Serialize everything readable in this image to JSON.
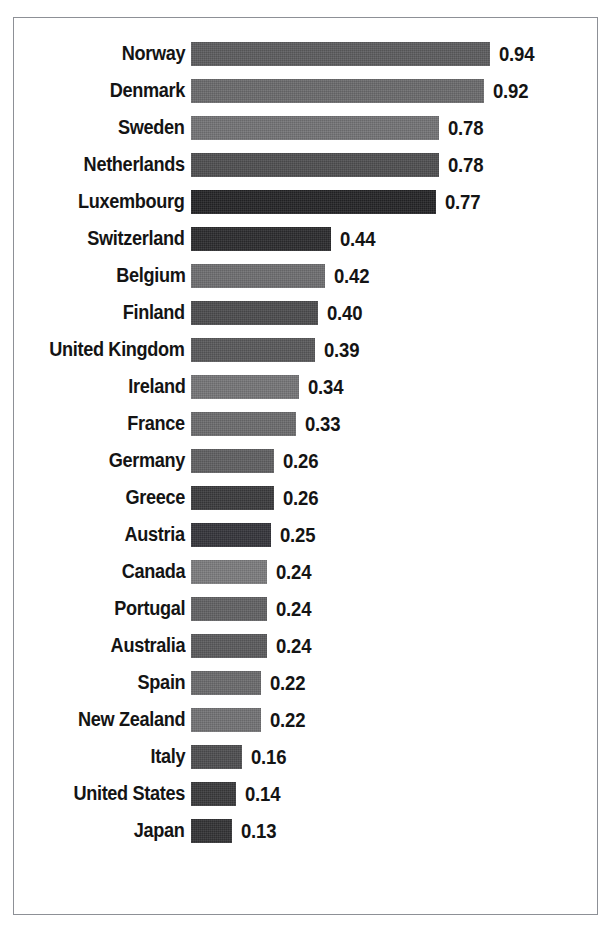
{
  "chart_data": {
    "type": "bar",
    "orientation": "horizontal",
    "title": "",
    "subtitle": "",
    "xlabel": "",
    "ylabel": "",
    "grid": false,
    "legend": "none",
    "axis_visible": false,
    "xlim": [
      0,
      0.94
    ],
    "value_format": "0.00",
    "categories": [
      "Norway",
      "Denmark",
      "Sweden",
      "Netherlands",
      "Luxembourg",
      "Switzerland",
      "Belgium",
      "Finland",
      "United Kingdom",
      "Ireland",
      "France",
      "Germany",
      "Greece",
      "Austria",
      "Canada",
      "Portugal",
      "Australia",
      "Spain",
      "New Zealand",
      "Italy",
      "United States",
      "Japan"
    ],
    "values": [
      0.94,
      0.92,
      0.78,
      0.78,
      0.77,
      0.44,
      0.42,
      0.4,
      0.39,
      0.34,
      0.33,
      0.26,
      0.26,
      0.25,
      0.24,
      0.24,
      0.24,
      0.22,
      0.22,
      0.16,
      0.14,
      0.13
    ],
    "value_labels": [
      "0.94",
      "0.92",
      "0.78",
      "0.78",
      "0.77",
      "0.44",
      "0.42",
      "0.40",
      "0.39",
      "0.34",
      "0.33",
      "0.26",
      "0.26",
      "0.25",
      "0.24",
      "0.24",
      "0.24",
      "0.22",
      "0.22",
      "0.16",
      "0.14",
      "0.13"
    ],
    "bar_colors": [
      "#5c5c5e",
      "#6a6a6c",
      "#737375",
      "#4e4e50",
      "#242426",
      "#2b2b2d",
      "#6e6e70",
      "#4b4b4d",
      "#58585a",
      "#757577",
      "#6b6b6d",
      "#5f5f61",
      "#3a3a3c",
      "#34343a",
      "#7b7b7d",
      "#616163",
      "#5a5a5c",
      "#6a6a6c",
      "#727274",
      "#4d4d4f",
      "#39393b",
      "#323234"
    ]
  },
  "figure": {
    "border_color": "#8d9096",
    "background": "#ffffff",
    "px_per_unit": 318
  }
}
